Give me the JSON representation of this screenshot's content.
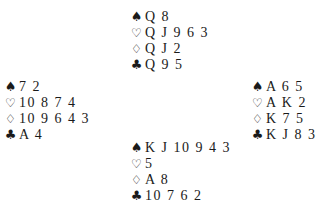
{
  "symbols": {
    "spades": "♠",
    "hearts": "♡",
    "diamonds": "♢",
    "clubs": "♣"
  },
  "hands": {
    "north": {
      "spades": "Q 8",
      "hearts": "Q J 9 6 3",
      "diamonds": "Q J 2",
      "clubs": "Q 9 5"
    },
    "west": {
      "spades": "7 2",
      "hearts": "10 8 7 4",
      "diamonds": "10 9 6 4 3",
      "clubs": "A 4"
    },
    "east": {
      "spades": "A 6 5",
      "hearts": "A K 2",
      "diamonds": "K 7 5",
      "clubs": "K J 8 3"
    },
    "south": {
      "spades": "K J 10 9 4 3",
      "hearts": "5",
      "diamonds": "A 8",
      "clubs": "10 7 6 2"
    }
  }
}
